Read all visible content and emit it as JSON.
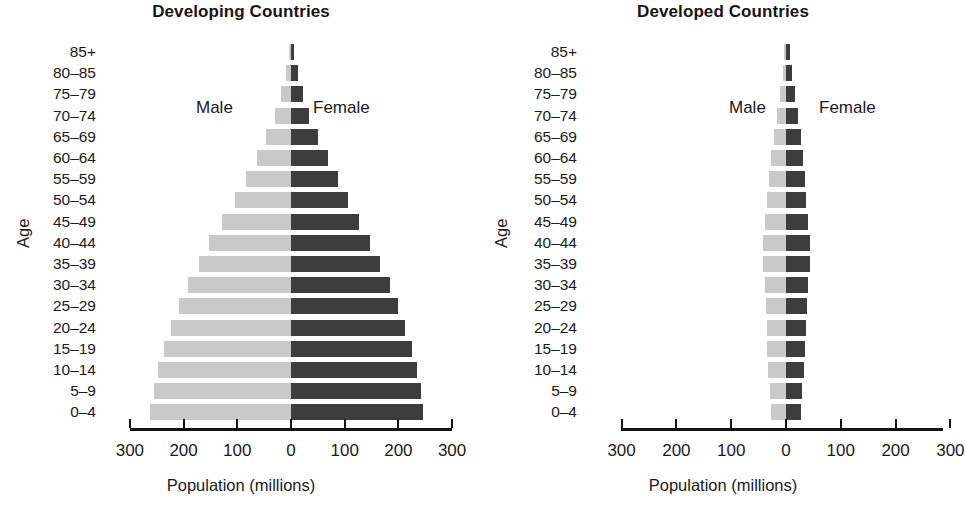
{
  "chart_data": {
    "type": "bar",
    "subtype": "population-pyramid",
    "xlabel": "Population (millions)",
    "ylabel": "Age",
    "xlim": [
      -300,
      300
    ],
    "xticks": [
      300,
      200,
      100,
      0,
      100,
      200,
      300
    ],
    "grid": false,
    "legend": [
      "Male",
      "Female"
    ],
    "legend_position": "inside-top",
    "categories": [
      "85+",
      "80–85",
      "75–79",
      "70–74",
      "65–69",
      "60–64",
      "55–59",
      "50–54",
      "45–49",
      "40–44",
      "35–39",
      "30–34",
      "25–29",
      "20–24",
      "15–19",
      "10–14",
      "5–9",
      "0–4"
    ],
    "panels": [
      {
        "title": "Developing Countries",
        "series": [
          {
            "name": "Male",
            "color": "#c9c9c9",
            "values": [
              4,
              10,
              18,
              30,
              46,
              64,
              84,
              105,
              128,
              152,
              172,
              192,
              209,
              223,
              236,
              247,
              255,
              263
            ]
          },
          {
            "name": "Female",
            "color": "#3d3d3d",
            "values": [
              6,
              13,
              22,
              34,
              50,
              68,
              87,
              107,
              127,
              148,
              166,
              184,
              200,
              213,
              225,
              235,
              242,
              246
            ]
          }
        ]
      },
      {
        "title": "Developed Countries",
        "series": [
          {
            "name": "Male",
            "color": "#c9c9c9",
            "values": [
              3,
              6,
              11,
              16,
              22,
              27,
              31,
              35,
              38,
              42,
              42,
              39,
              37,
              35,
              34,
              33,
              30,
              28
            ]
          },
          {
            "name": "Female",
            "color": "#3d3d3d",
            "values": [
              7,
              11,
              17,
              22,
              27,
              31,
              34,
              37,
              40,
              44,
              43,
              40,
              38,
              36,
              34,
              32,
              29,
              27
            ]
          }
        ]
      }
    ]
  },
  "panels": [
    {
      "title": "Developing Countries",
      "axis_title": "Population (millions)",
      "age_axis_label": "Age",
      "legend_male": "Male",
      "legend_female": "Female",
      "tick_labels": [
        "300",
        "200",
        "100",
        "0",
        "100",
        "200",
        "300"
      ]
    },
    {
      "title": "Developed Countries",
      "axis_title": "Population (millions)",
      "age_axis_label": "Age",
      "legend_male": "Male",
      "legend_female": "Female",
      "tick_labels": [
        "300",
        "200",
        "100",
        "0",
        "100",
        "200",
        "300"
      ]
    }
  ]
}
